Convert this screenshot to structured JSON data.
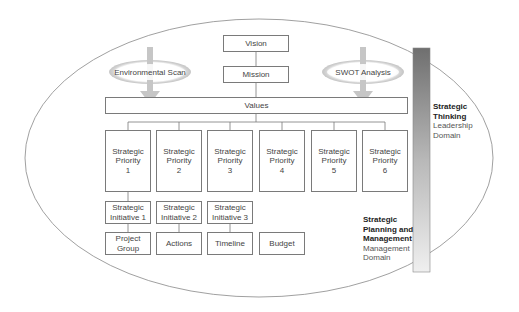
{
  "diagram": {
    "top": {
      "vision": "Vision",
      "mission": "Mission",
      "values": "Values"
    },
    "inputs": [
      {
        "label": "Environmental Scan"
      },
      {
        "label": "SWOT Analysis"
      }
    ],
    "priorities": [
      {
        "line1": "Strategic",
        "line2": "Priority",
        "num": "1"
      },
      {
        "line1": "Strategic",
        "line2": "Priority",
        "num": "2"
      },
      {
        "line1": "Strategic",
        "line2": "Priority",
        "num": "3"
      },
      {
        "line1": "Strategic",
        "line2": "Priority",
        "num": "4"
      },
      {
        "line1": "Strategic",
        "line2": "Priority",
        "num": "5"
      },
      {
        "line1": "Strategic",
        "line2": "Priority",
        "num": "6"
      }
    ],
    "initiatives": [
      {
        "line1": "Strategic",
        "line2": "Initiative 1"
      },
      {
        "line1": "Strategic",
        "line2": "Initiative 2"
      },
      {
        "line1": "Strategic",
        "line2": "Initiative 3"
      }
    ],
    "components": [
      {
        "line1": "Project",
        "line2": "Group"
      },
      {
        "line1": "Actions",
        "line2": ""
      },
      {
        "line1": "Timeline",
        "line2": ""
      },
      {
        "line1": "Budget",
        "line2": ""
      }
    ],
    "domains": {
      "thinking": {
        "bold1": "Strategic",
        "bold2": "Thinking",
        "sub1": "Leadership",
        "sub2": "Domain"
      },
      "planning": {
        "bold1": "Strategic",
        "bold2": "Planning and",
        "bold3": "Management",
        "sub1": "Management",
        "sub2": "Domain"
      }
    },
    "colors": {
      "line": "#7a7a7a",
      "arrow": "#c8c8c8",
      "bar_top": "#707070",
      "bar_bottom": "#ececec"
    }
  }
}
